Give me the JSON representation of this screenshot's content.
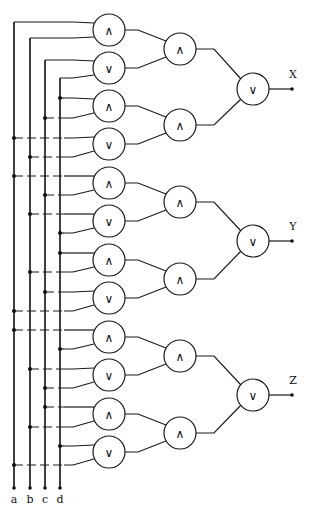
{
  "diagram": {
    "type": "logic-circuit",
    "inputs": [
      {
        "name": "a",
        "label": "a",
        "x": 14
      },
      {
        "name": "b",
        "label": "b",
        "x": 30
      },
      {
        "name": "c",
        "label": "c",
        "x": 45
      },
      {
        "name": "d",
        "label": "d",
        "x": 60
      }
    ],
    "bus_top": 22,
    "bus_bottom": 488,
    "input_label_y": 503,
    "symbols": {
      "and": "∧",
      "or": "∨"
    },
    "layer1": {
      "x": 109,
      "r": 16,
      "gates": [
        {
          "id": "g1",
          "op": "and",
          "y": 30,
          "in": [
            "a",
            "b"
          ],
          "taps": [
            22,
            38
          ],
          "corner": true
        },
        {
          "id": "g2",
          "op": "or",
          "y": 68,
          "in": [
            "c",
            "d"
          ],
          "taps": [
            60,
            78
          ],
          "corner": true
        },
        {
          "id": "g3",
          "op": "and",
          "y": 106,
          "in": [
            "d",
            "c"
          ],
          "taps": [
            98,
            118
          ]
        },
        {
          "id": "g4",
          "op": "or",
          "y": 144,
          "in": [
            "a",
            "b"
          ],
          "taps": [
            138,
            157
          ]
        },
        {
          "id": "g5",
          "op": "and",
          "y": 183,
          "in": [
            "a",
            "c"
          ],
          "taps": [
            176,
            195
          ]
        },
        {
          "id": "g6",
          "op": "or",
          "y": 221,
          "in": [
            "b",
            "d"
          ],
          "taps": [
            214,
            233
          ]
        },
        {
          "id": "g7",
          "op": "and",
          "y": 260,
          "in": [
            "d",
            "b"
          ],
          "taps": [
            253,
            272
          ]
        },
        {
          "id": "g8",
          "op": "or",
          "y": 298,
          "in": [
            "c",
            "a"
          ],
          "taps": [
            292,
            311
          ]
        },
        {
          "id": "g9",
          "op": "and",
          "y": 337,
          "in": [
            "a",
            "d"
          ],
          "taps": [
            330,
            349
          ]
        },
        {
          "id": "g10",
          "op": "or",
          "y": 375,
          "in": [
            "b",
            "c"
          ],
          "taps": [
            369,
            388
          ]
        },
        {
          "id": "g11",
          "op": "and",
          "y": 414,
          "in": [
            "c",
            "b"
          ],
          "taps": [
            407,
            427
          ]
        },
        {
          "id": "g12",
          "op": "or",
          "y": 452,
          "in": [
            "d",
            "a"
          ],
          "taps": [
            446,
            465
          ]
        }
      ]
    },
    "layer2": {
      "x": 180,
      "r": 16,
      "gates": [
        {
          "id": "h1",
          "op": "and",
          "y": 49,
          "in": [
            "g1",
            "g2"
          ]
        },
        {
          "id": "h2",
          "op": "and",
          "y": 125,
          "in": [
            "g3",
            "g4"
          ]
        },
        {
          "id": "h3",
          "op": "and",
          "y": 202,
          "in": [
            "g5",
            "g6"
          ]
        },
        {
          "id": "h4",
          "op": "and",
          "y": 279,
          "in": [
            "g7",
            "g8"
          ]
        },
        {
          "id": "h5",
          "op": "and",
          "y": 356,
          "in": [
            "g9",
            "g10"
          ]
        },
        {
          "id": "h6",
          "op": "and",
          "y": 433,
          "in": [
            "g11",
            "g12"
          ]
        }
      ]
    },
    "layer3": {
      "x": 253,
      "r": 16,
      "gates": [
        {
          "id": "k1",
          "op": "or",
          "y": 89,
          "in": [
            "h1",
            "h2"
          ],
          "output": "X"
        },
        {
          "id": "k2",
          "op": "or",
          "y": 241,
          "in": [
            "h3",
            "h4"
          ],
          "output": "Y"
        },
        {
          "id": "k3",
          "op": "or",
          "y": 395,
          "in": [
            "h5",
            "h6"
          ],
          "output": "Z"
        }
      ]
    },
    "outputs": [
      {
        "name": "X",
        "label": "X",
        "y": 89
      },
      {
        "name": "Y",
        "label": "Y",
        "y": 241
      },
      {
        "name": "Z",
        "label": "Z",
        "y": 395
      }
    ],
    "output_x": 292
  }
}
